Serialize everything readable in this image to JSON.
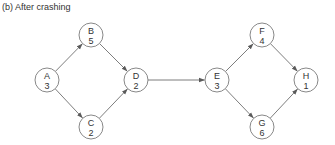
{
  "caption": "(b) After crashing",
  "colors": {
    "node_stroke": "#7a7a7a",
    "edge_stroke": "#6e6e6e",
    "text": "#333333",
    "background": "#ffffff"
  },
  "nodes": [
    {
      "id": "A",
      "label": "A",
      "duration": "3",
      "cx": 47,
      "cy": 80
    },
    {
      "id": "B",
      "label": "B",
      "duration": "5",
      "cx": 91,
      "cy": 35
    },
    {
      "id": "C",
      "label": "C",
      "duration": "2",
      "cx": 91,
      "cy": 127
    },
    {
      "id": "D",
      "label": "D",
      "duration": "2",
      "cx": 136,
      "cy": 80
    },
    {
      "id": "E",
      "label": "E",
      "duration": "3",
      "cx": 217,
      "cy": 80
    },
    {
      "id": "F",
      "label": "F",
      "duration": "4",
      "cx": 262,
      "cy": 35
    },
    {
      "id": "G",
      "label": "G",
      "duration": "6",
      "cx": 262,
      "cy": 127
    },
    {
      "id": "H",
      "label": "H",
      "duration": "1",
      "cx": 306,
      "cy": 80
    }
  ],
  "edges": [
    {
      "from": "A",
      "to": "B"
    },
    {
      "from": "A",
      "to": "C"
    },
    {
      "from": "B",
      "to": "D"
    },
    {
      "from": "C",
      "to": "D"
    },
    {
      "from": "D",
      "to": "E"
    },
    {
      "from": "E",
      "to": "F"
    },
    {
      "from": "E",
      "to": "G"
    },
    {
      "from": "F",
      "to": "H"
    },
    {
      "from": "G",
      "to": "H"
    }
  ],
  "node_radius": 12
}
